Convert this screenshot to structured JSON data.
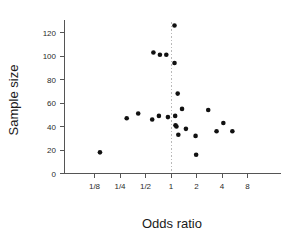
{
  "chart_data": {
    "type": "scatter",
    "title": "",
    "xlabel": "Odds  ratio",
    "ylabel": "Sample size",
    "xscale": "log2",
    "xlim": [
      0.0625,
      11.3
    ],
    "ylim": [
      0,
      132
    ],
    "grid": false,
    "legend": null,
    "xticks": [
      {
        "value": 0.125,
        "label": "1/8"
      },
      {
        "value": 0.25,
        "label": "1/4"
      },
      {
        "value": 0.5,
        "label": "1/2"
      },
      {
        "value": 1,
        "label": "1"
      },
      {
        "value": 2,
        "label": "2"
      },
      {
        "value": 4,
        "label": "4"
      },
      {
        "value": 8,
        "label": "8"
      }
    ],
    "yticks": [
      {
        "value": 0,
        "label": "0"
      },
      {
        "value": 20,
        "label": "20"
      },
      {
        "value": 40,
        "label": "40"
      },
      {
        "value": 60,
        "label": "60"
      },
      {
        "value": 80,
        "label": "80"
      },
      {
        "value": 100,
        "label": "100"
      },
      {
        "value": 120,
        "label": "120"
      }
    ],
    "reference_lines": [
      {
        "orientation": "vertical",
        "value": 1,
        "style": "dotted",
        "color": "#b9b9b9"
      }
    ],
    "point_color": "#111111",
    "point_radius": 2.3,
    "points": [
      {
        "x": 0.145,
        "y": 18
      },
      {
        "x": 0.3,
        "y": 47
      },
      {
        "x": 0.41,
        "y": 51
      },
      {
        "x": 0.6,
        "y": 46
      },
      {
        "x": 0.62,
        "y": 103
      },
      {
        "x": 0.72,
        "y": 49
      },
      {
        "x": 0.74,
        "y": 101
      },
      {
        "x": 0.88,
        "y": 101
      },
      {
        "x": 0.92,
        "y": 48
      },
      {
        "x": 1.1,
        "y": 126
      },
      {
        "x": 1.1,
        "y": 94
      },
      {
        "x": 1.12,
        "y": 49
      },
      {
        "x": 1.13,
        "y": 41
      },
      {
        "x": 1.16,
        "y": 40
      },
      {
        "x": 1.2,
        "y": 68
      },
      {
        "x": 1.22,
        "y": 33
      },
      {
        "x": 1.35,
        "y": 55
      },
      {
        "x": 1.5,
        "y": 38
      },
      {
        "x": 1.95,
        "y": 32
      },
      {
        "x": 1.98,
        "y": 16
      },
      {
        "x": 2.75,
        "y": 54
      },
      {
        "x": 3.45,
        "y": 36
      },
      {
        "x": 4.15,
        "y": 43
      },
      {
        "x": 5.3,
        "y": 36
      }
    ]
  },
  "axes": {
    "x_title": "Odds  ratio",
    "y_title": "Sample size"
  }
}
